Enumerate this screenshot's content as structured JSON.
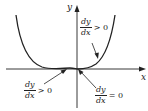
{
  "diagram": {
    "axes": {
      "x_label": "x",
      "y_label": "y"
    },
    "curve": {
      "description": "U-shaped curve flattening near origin (like y = x^4 shifted), touching x-axis around the origin",
      "color": "#222222"
    },
    "annotations": [
      {
        "id": "upper-right",
        "numerator": "dy",
        "denominator": "dx",
        "relation": "> 0",
        "points_to": "right branch of curve"
      },
      {
        "id": "lower-left",
        "numerator": "dy",
        "denominator": "dx",
        "relation": "> 0",
        "points_to": "left flat region near origin"
      },
      {
        "id": "lower-right",
        "numerator": "dy",
        "denominator": "dx",
        "relation": "= 0",
        "points_to": "origin"
      }
    ]
  }
}
